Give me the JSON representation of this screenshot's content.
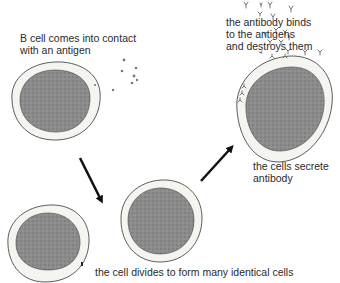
{
  "diagram": {
    "type": "B-cell immune response process",
    "labels": {
      "step1": "B cell comes into contact\nwith an antigen",
      "step2": "the cell divides to form many identical cells",
      "step3": "the cells secrete\nantibody",
      "step4": "the antibody binds\nto the antigens\nand destroys them"
    },
    "colors": {
      "nucleus": "#8a8a8a",
      "cytoplasm": "#f4f4f0",
      "outline": "#333333",
      "arrow": "#111111",
      "antigen": "#777777",
      "antibody": "#666666"
    },
    "elements": [
      {
        "name": "b-cell-initial",
        "kind": "cell"
      },
      {
        "name": "antigens",
        "kind": "particles"
      },
      {
        "name": "arrow-down",
        "kind": "arrow"
      },
      {
        "name": "daughter-cell-left",
        "kind": "cell"
      },
      {
        "name": "daughter-cell-right",
        "kind": "cell"
      },
      {
        "name": "arrow-up-right",
        "kind": "arrow"
      },
      {
        "name": "plasma-cell-with-antibodies",
        "kind": "cell"
      },
      {
        "name": "antibodies",
        "kind": "particles"
      }
    ]
  }
}
